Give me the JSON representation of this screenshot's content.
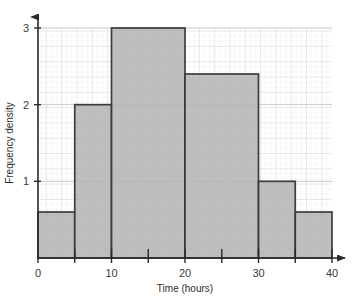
{
  "chart_data": {
    "type": "bar",
    "title": "",
    "subtitle": "",
    "xlabel": "Time (hours)",
    "ylabel": "Frequency density",
    "xlim": [
      0,
      40
    ],
    "ylim": [
      0,
      3
    ],
    "grid": true,
    "legend": false,
    "legend_position": "none",
    "x_ticks": [
      "0",
      "10",
      "20",
      "30",
      "40"
    ],
    "x_tick_values": [
      0,
      10,
      20,
      30,
      40
    ],
    "y_ticks": [
      "1",
      "2",
      "3"
    ],
    "y_tick_values": [
      1,
      2,
      3
    ],
    "x_minor_tick_interval": 5,
    "categories": [
      "0-5",
      "5-10",
      "10-20",
      "20-30",
      "30-35",
      "35-40"
    ],
    "bin_edges": [
      0,
      5,
      10,
      20,
      30,
      35,
      40
    ],
    "values": [
      0.6,
      2.0,
      3.0,
      2.4,
      1.0,
      0.6
    ],
    "bars": [
      {
        "label": "0-5",
        "start": 0,
        "end": 5,
        "height": 0.6
      },
      {
        "label": "5-10",
        "start": 5,
        "end": 10,
        "height": 2.0
      },
      {
        "label": "10-20",
        "start": 10,
        "end": 20,
        "height": 3.0
      },
      {
        "label": "20-30",
        "start": 20,
        "end": 30,
        "height": 2.4
      },
      {
        "label": "30-35",
        "start": 30,
        "end": 35,
        "height": 1.0
      },
      {
        "label": "35-40",
        "start": 35,
        "end": 40,
        "height": 0.6
      }
    ],
    "colors": {
      "bar_fill": "#b3b3b3",
      "bar_stroke": "#3c3c3c",
      "axis": "#2a2a2a",
      "grid_minor": "#e8e8ea",
      "grid_major": "#d2d2d8",
      "background": "#ffffff",
      "text": "#2e2e2e"
    }
  }
}
